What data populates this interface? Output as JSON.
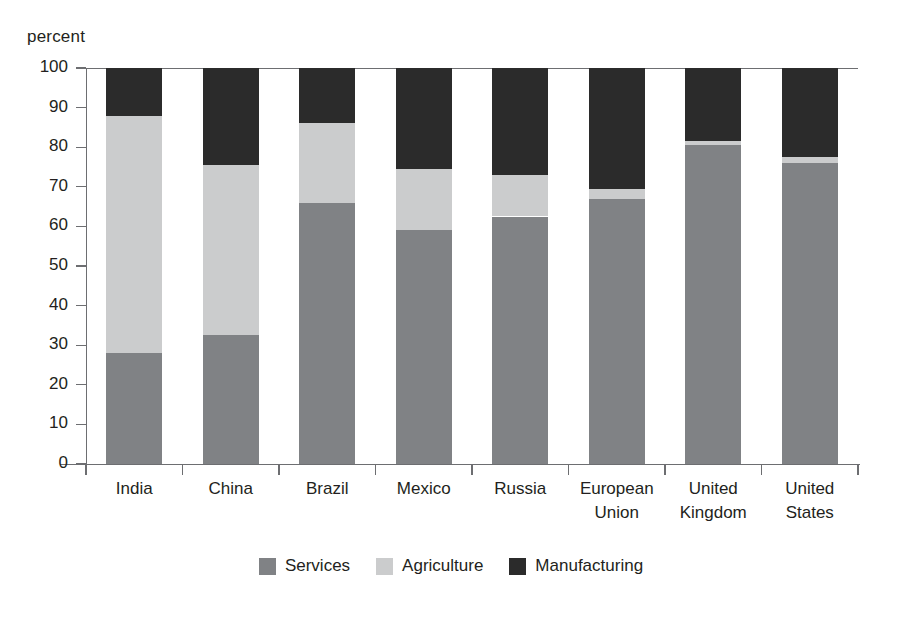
{
  "chart_data": {
    "type": "bar",
    "subtype": "stacked-bar-100",
    "title": "",
    "xlabel": "",
    "ylabel": "percent",
    "ylim": [
      0,
      100
    ],
    "ytick_step": 10,
    "yticks": [
      "0",
      "10",
      "20",
      "30",
      "40",
      "50",
      "60",
      "70",
      "80",
      "90",
      "100"
    ],
    "grid": false,
    "legend_position": "bottom-center",
    "categories": [
      "India",
      "China",
      "Brazil",
      "Mexico",
      "Russia",
      "European Union",
      "United Kingdom",
      "United States"
    ],
    "category_lines": [
      [
        "India"
      ],
      [
        "China"
      ],
      [
        "Brazil"
      ],
      [
        "Mexico"
      ],
      [
        "Russia"
      ],
      [
        "European",
        "Union"
      ],
      [
        "United",
        "Kingdom"
      ],
      [
        "United",
        "States"
      ]
    ],
    "series": [
      {
        "name": "Services",
        "color": "#808285",
        "values": [
          28,
          32.5,
          66,
          59,
          62.5,
          67,
          80.5,
          76
        ]
      },
      {
        "name": "Agriculture",
        "color": "#cbcccd",
        "values": [
          60,
          43,
          20,
          15.5,
          10.5,
          2.5,
          1,
          1.5
        ]
      },
      {
        "name": "Manufacturing",
        "color": "#2b2b2b",
        "values": [
          12,
          24.5,
          14,
          25.5,
          27,
          30.5,
          18.5,
          22.5
        ]
      }
    ],
    "cumulative_tops": {
      "Services": [
        28,
        32.5,
        66,
        59,
        62.5,
        67,
        80.5,
        76
      ],
      "Agriculture": [
        88,
        75.5,
        86,
        74.5,
        73,
        69.5,
        81.5,
        77.5
      ],
      "Manufacturing": [
        100,
        100,
        100,
        100,
        100,
        100,
        100,
        100
      ]
    },
    "legend": [
      {
        "label": "Services",
        "color": "#808285"
      },
      {
        "label": "Agriculture",
        "color": "#cbcccd"
      },
      {
        "label": "Manufacturing",
        "color": "#2b2b2b"
      }
    ],
    "axis_color": "#6d6e71",
    "background": "#ffffff"
  }
}
